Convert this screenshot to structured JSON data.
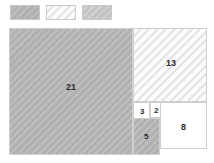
{
  "legend": {
    "swatches": [
      {
        "name": "swatch-gray",
        "fill": "#b4b4b4",
        "style": "hatch-gray",
        "label": ""
      },
      {
        "name": "swatch-white",
        "fill": "#fbfbfb",
        "style": "hatch-white",
        "label": ""
      },
      {
        "name": "swatch-light",
        "fill": "#c6c6c6",
        "style": "hatch-light",
        "label": ""
      }
    ]
  },
  "diagram": {
    "title": "",
    "type": "fibonacci-squares",
    "squares": [
      {
        "label": "21",
        "fill": "#b4b4b4",
        "pattern": "diagonal-hatch"
      },
      {
        "label": "13",
        "fill": "#fbfbfb",
        "pattern": "diagonal-hatch"
      },
      {
        "label": "8",
        "fill": "#ffffff",
        "pattern": "solid"
      },
      {
        "label": "5",
        "fill": "#b4b4b4",
        "pattern": "diagonal-hatch"
      },
      {
        "label": "3",
        "fill": "#ffffff",
        "pattern": "solid"
      },
      {
        "label": "2",
        "fill": "#ffffff",
        "pattern": "solid"
      }
    ],
    "colors": {
      "gray": "#b4b4b4",
      "light": "#c6c6c6",
      "white": "#ffffff",
      "border": "#cfcfcf",
      "text": "#2b2b2b"
    }
  }
}
